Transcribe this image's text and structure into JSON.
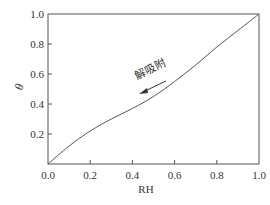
{
  "chart_data": {
    "type": "line",
    "title": "",
    "xlabel": "RH",
    "ylabel": "θ",
    "xlim": [
      0.0,
      1.0
    ],
    "ylim": [
      0.0,
      1.0
    ],
    "xticks": [
      "0.0",
      "0.2",
      "0.4",
      "0.6",
      "0.8",
      "1.0"
    ],
    "yticks": [
      "0.2",
      "0.4",
      "0.6",
      "0.8",
      "1.0"
    ],
    "grid": false,
    "legend": null,
    "series": [
      {
        "name": "解吸附",
        "x": [
          0.0,
          0.1,
          0.2,
          0.3,
          0.4,
          0.5,
          0.6,
          0.7,
          0.8,
          0.9,
          1.0
        ],
        "values": [
          0.0,
          0.12,
          0.22,
          0.3,
          0.37,
          0.45,
          0.55,
          0.66,
          0.78,
          0.89,
          1.0
        ]
      }
    ],
    "annotations": [
      {
        "text": "解吸附",
        "arrow": "left",
        "x": 0.5,
        "y": 0.55
      }
    ],
    "line_color": "#555555"
  },
  "labels": {
    "x_axis": "RH",
    "y_axis": "θ",
    "annotation": "解吸附"
  }
}
